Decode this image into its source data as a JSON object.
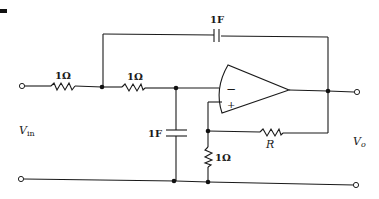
{
  "diagram": {
    "type": "circuit-schematic",
    "title_marker": "—",
    "components": {
      "r_input": {
        "label": "1Ω",
        "type": "resistor"
      },
      "r_series": {
        "label": "1Ω",
        "type": "resistor"
      },
      "c_feedback": {
        "label": "1F",
        "type": "capacitor"
      },
      "c_shunt": {
        "label": "1F",
        "type": "capacitor"
      },
      "r_feedback": {
        "label": "R",
        "type": "resistor"
      },
      "r_ground": {
        "label": "1Ω",
        "type": "resistor"
      },
      "opamp": {
        "minus": "−",
        "plus": "+",
        "type": "op-amp"
      }
    },
    "labels": {
      "vin_main": "V",
      "vin_sub": "in",
      "vo_main": "V",
      "vo_sub": "o"
    }
  }
}
